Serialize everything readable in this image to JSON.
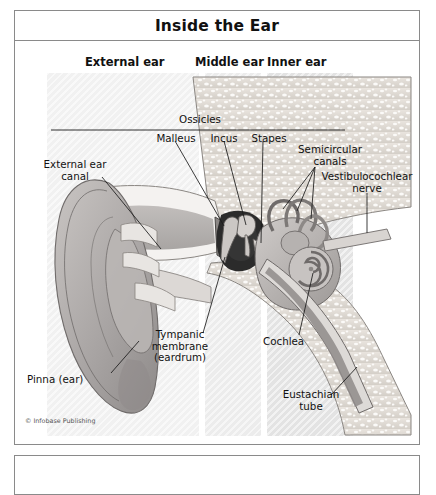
{
  "figure": {
    "title": "Inside the Ear",
    "credit": "© Infobase Publishing",
    "type": "anatomical-diagram"
  },
  "regions": [
    {
      "id": "external",
      "label": "External ear"
    },
    {
      "id": "middle",
      "label": "Middle ear"
    },
    {
      "id": "inner",
      "label": "Inner ear"
    }
  ],
  "ossicles": {
    "group_label": "Ossicles",
    "items": [
      {
        "label": "Malleus"
      },
      {
        "label": "Incus"
      },
      {
        "label": "Stapes"
      }
    ]
  },
  "callouts": [
    {
      "id": "external-ear-canal",
      "label": "External ear\ncanal"
    },
    {
      "id": "semicircular-canals",
      "label": "Semicircular\ncanals"
    },
    {
      "id": "vestibulocochlear-nerve",
      "label": "Vestibulocochlear\nnerve"
    },
    {
      "id": "tympanic-membrane",
      "label": "Tympanic\nmembrane\n(eardrum)"
    },
    {
      "id": "pinna",
      "label": "Pinna (ear)"
    },
    {
      "id": "cochlea",
      "label": "Cochlea"
    },
    {
      "id": "eustachian-tube",
      "label": "Eustachian\ntube"
    }
  ],
  "colors": {
    "frame": "#8a8a8a",
    "text": "#111111",
    "band_external": "#f1f1f1",
    "band_middle": "#ececec",
    "band_inner": "#e3e3e3",
    "bone": "#ded9d4",
    "cartilage": "#b9b5b4",
    "canal": "#9b9896",
    "dark": "#2b2b2b"
  }
}
